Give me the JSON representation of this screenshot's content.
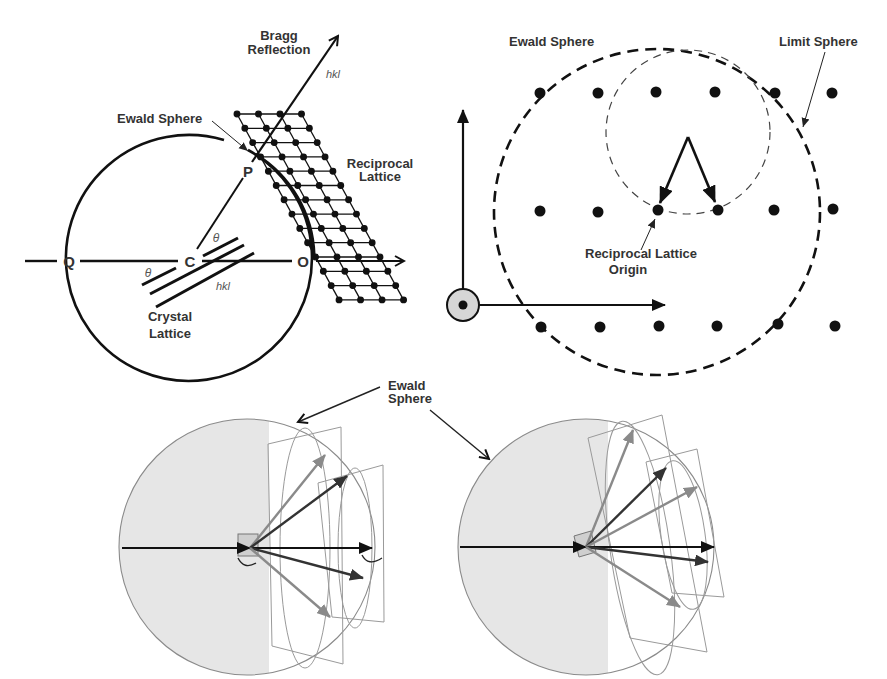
{
  "figure": {
    "panels": [
      {
        "id": "bragg-ewald-2d",
        "labels": {
          "bragg_line1": "Bragg",
          "bragg_line2": "Reflection",
          "hkl_top": "hkl",
          "ewald_sphere": "Ewald Sphere",
          "reciprocal_line1": "Reciprocal",
          "reciprocal_line2": "Lattice",
          "point_p": "P",
          "point_q": "Q",
          "point_c": "C",
          "point_o": "O",
          "theta_upper": "θ",
          "theta_lower": "θ",
          "hkl_planes": "hkl",
          "crystal_line1": "Crystal",
          "crystal_line2": "Lattice"
        }
      },
      {
        "id": "limit-sphere",
        "labels": {
          "ewald_sphere": "Ewald Sphere",
          "limit_sphere": "Limit Sphere",
          "origin_line1": "Reciprocal Lattice",
          "origin_line2": "Origin"
        }
      },
      {
        "id": "ewald-3d-rotation",
        "labels": {
          "ewald_line1": "Ewald",
          "ewald_line2": "Sphere"
        }
      }
    ],
    "colors": {
      "ink": "#111111",
      "text": "#333333",
      "sphere_fill": "#e6e6e6",
      "sphere_edge": "#888888",
      "gray_arrow": "#8a8a8a",
      "plane_edge": "#9a9a9a"
    }
  }
}
